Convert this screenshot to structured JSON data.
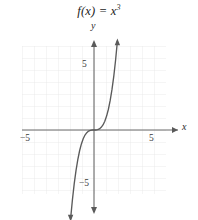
{
  "figure": {
    "title_prefix": "f(x) = x",
    "title_exponent": "3",
    "title_full": "f(x) = x³",
    "background_color": "#ffffff"
  },
  "axes": {
    "x_label": "x",
    "y_label": "y",
    "axis_color": "#6b6b6b",
    "grid_color": "#e4e4e4",
    "x_range": [
      -7.0,
      7.0
    ],
    "y_range": [
      -7.0,
      7.0
    ],
    "grid_step": 1,
    "grid_visible": true
  },
  "ticks": {
    "x": [
      {
        "value": -5,
        "label": "−5"
      },
      {
        "value": 5,
        "label": "5"
      }
    ],
    "y": [
      {
        "value": 5,
        "label": "5"
      },
      {
        "value": -5,
        "label": "−5"
      }
    ]
  },
  "chart_data": {
    "type": "line",
    "xlabel": "x",
    "ylabel": "y",
    "xlim": [
      -7,
      7
    ],
    "ylim": [
      -7,
      7
    ],
    "grid": true,
    "legend": null,
    "curve_color": "#5a5a5a",
    "series": [
      {
        "name": "f(x) = x³",
        "equation": "y = x^3",
        "x": [
          -1.95,
          -1.8,
          -1.65,
          -1.5,
          -1.35,
          -1.2,
          -1.05,
          -0.9,
          -0.75,
          -0.6,
          -0.45,
          -0.3,
          -0.15,
          0,
          0.15,
          0.3,
          0.45,
          0.6,
          0.75,
          0.9,
          1.05,
          1.2,
          1.35,
          1.5,
          1.65,
          1.8,
          1.95
        ],
        "y": [
          -7.41,
          -5.83,
          -4.49,
          -3.38,
          -2.46,
          -1.73,
          -1.16,
          -0.73,
          -0.42,
          -0.22,
          -0.09,
          -0.03,
          0.0,
          0,
          0.0,
          0.03,
          0.09,
          0.22,
          0.42,
          0.73,
          1.16,
          1.73,
          2.46,
          3.38,
          4.49,
          5.83,
          7.41
        ]
      }
    ]
  }
}
